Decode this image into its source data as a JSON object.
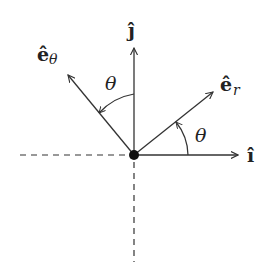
{
  "diagram": {
    "origin": {
      "x": 134,
      "y": 155
    },
    "colors": {
      "stroke": "#333333",
      "text": "#222222",
      "background": "#ffffff"
    },
    "labels": {
      "j_hat": "ĵ",
      "i_hat": "î",
      "e_r_base": "ê",
      "e_r_sub": "r",
      "e_theta_base": "ê",
      "e_theta_sub": "θ",
      "theta_upper": "θ",
      "theta_lower": "θ"
    },
    "vectors": [
      {
        "name": "i-hat",
        "label": "î",
        "direction": "horizontal right"
      },
      {
        "name": "j-hat",
        "label": "ĵ",
        "direction": "vertical up"
      },
      {
        "name": "e-r",
        "label": "êr",
        "angle_from_i": "θ"
      },
      {
        "name": "e-theta",
        "label": "êθ",
        "angle_from_j": "θ"
      }
    ],
    "angles": [
      {
        "name": "theta-between-i-and-er",
        "label": "θ"
      },
      {
        "name": "theta-between-j-and-etheta",
        "label": "θ"
      }
    ],
    "axes_extensions": [
      "negative x dashed",
      "negative y dashed"
    ]
  }
}
